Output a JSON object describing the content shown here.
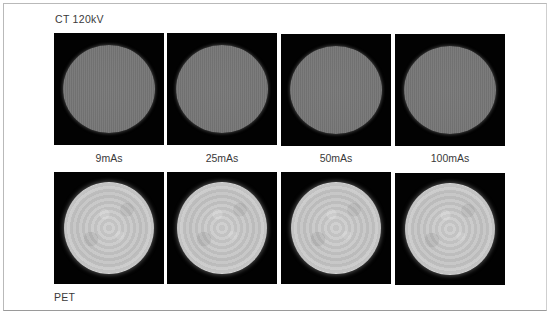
{
  "figure": {
    "top_row_label": "CT  120kV",
    "bottom_row_label": "PET",
    "dose_labels": [
      "9mAs",
      "25mAs",
      "50mAs",
      "100mAs"
    ],
    "ct_panels": [
      {
        "dose": "9mAs",
        "modality": "CT"
      },
      {
        "dose": "25mAs",
        "modality": "CT"
      },
      {
        "dose": "50mAs",
        "modality": "CT"
      },
      {
        "dose": "100mAs",
        "modality": "CT"
      }
    ],
    "pet_panels": [
      {
        "dose": "9mAs",
        "modality": "PET"
      },
      {
        "dose": "25mAs",
        "modality": "PET"
      },
      {
        "dose": "50mAs",
        "modality": "PET"
      },
      {
        "dose": "100mAs",
        "modality": "PET"
      }
    ],
    "colors": {
      "background": "#ffffff",
      "panel_background": "#020202",
      "ct_phantom": "#777777",
      "pet_phantom": "#c8c8c8",
      "frame_border": "#b9b9b9"
    }
  }
}
